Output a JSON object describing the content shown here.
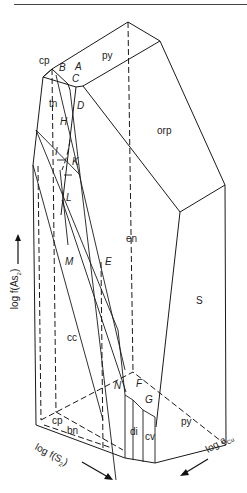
{
  "figure": {
    "type": "3D phase diagram (block diagram)",
    "axes": {
      "vertical": {
        "text": "log f(As",
        "sub": "2",
        "tail": ")",
        "arrow": "up"
      },
      "left_front": {
        "text": "log f(S",
        "sub": "2",
        "tail": ")",
        "arrow": "down-right"
      },
      "right_front": {
        "text": "log a",
        "sub": "Cu",
        "arrow": "down-left"
      }
    },
    "phase_fields": [
      {
        "id": "cp_top",
        "label": "cp"
      },
      {
        "id": "py_top",
        "label": "py"
      },
      {
        "id": "tn",
        "label": "tn"
      },
      {
        "id": "orp",
        "label": "orp"
      },
      {
        "id": "en",
        "label": "en"
      },
      {
        "id": "S",
        "label": "S"
      },
      {
        "id": "cc",
        "label": "cc"
      },
      {
        "id": "cp_bottom",
        "label": "cp"
      },
      {
        "id": "bn",
        "label": "bn"
      },
      {
        "id": "di",
        "label": "di"
      },
      {
        "id": "cv",
        "label": "cv"
      },
      {
        "id": "py_bottom",
        "label": "py"
      }
    ],
    "invariant_points": [
      {
        "label": "A"
      },
      {
        "label": "B"
      },
      {
        "label": "C"
      },
      {
        "label": "D"
      },
      {
        "label": "H"
      },
      {
        "label": "I"
      },
      {
        "label": "K"
      },
      {
        "label": "L"
      },
      {
        "label": "M"
      },
      {
        "label": "E"
      },
      {
        "label": "N"
      },
      {
        "label": "F"
      },
      {
        "label": "G"
      }
    ]
  }
}
